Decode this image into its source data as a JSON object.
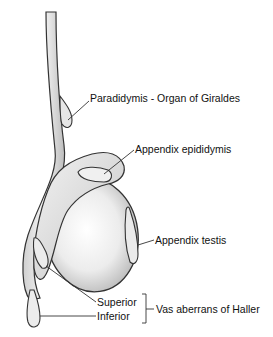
{
  "figure": {
    "type": "anatomical illustration"
  },
  "labels": {
    "paradidymis": "Paradidymis - Organ of Giraldes",
    "appendix_epididymis": "Appendix epididymis",
    "appendix_testis": "Appendix testis",
    "superior": "Superior",
    "inferior": "Inferior",
    "vas_aberrans": "Vas aberrans of Haller"
  }
}
